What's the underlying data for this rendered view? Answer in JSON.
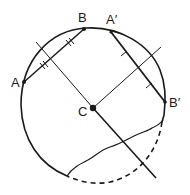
{
  "diagram": {
    "type": "geometry-construction",
    "colors": {
      "stroke": "#1a1a1a",
      "background": "#ffffff"
    },
    "points": {
      "A": {
        "label": "A",
        "x": 24,
        "y": 82
      },
      "B": {
        "label": "B",
        "x": 84,
        "y": 29
      },
      "A2": {
        "label": "A′",
        "x": 111,
        "y": 32
      },
      "B2": {
        "label": "B′",
        "x": 165,
        "y": 102
      },
      "C": {
        "label": "C",
        "x": 93,
        "y": 108
      }
    },
    "chords": [
      {
        "name": "AB",
        "from": "A",
        "to": "B",
        "tick_marks": "double"
      },
      {
        "name": "A′B′",
        "from": "A2",
        "to": "B2",
        "tick_marks": "single"
      }
    ],
    "bisectors": [
      {
        "name": "perpendicular-bisector-AB"
      },
      {
        "name": "perpendicular-bisector-A′B′"
      }
    ],
    "break_line": "wavy",
    "hidden_arc": "dashed"
  }
}
